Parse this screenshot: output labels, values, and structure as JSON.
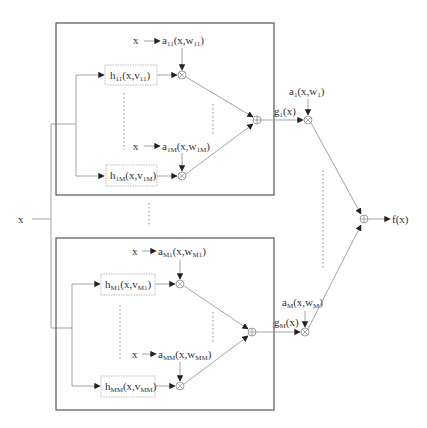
{
  "diagram": {
    "type": "hierarchical mixture of experts block diagram",
    "input_label": "x",
    "output_label": "f(x)",
    "groups": [
      {
        "id": "group-1",
        "experts": [
          {
            "h": "h",
            "h_sub": "11",
            "args_pre": "(x,v",
            "args_sub": "11",
            "args_post": ")",
            "gate_in": "x",
            "a": "a",
            "a_sub": "11",
            "a_pre": "(x,w",
            "a_arg_sub": "11",
            "a_post": ")"
          },
          {
            "h": "h",
            "h_sub": "1M",
            "args_pre": "(x,v",
            "args_sub": "1M",
            "args_post": ")",
            "gate_in": "x",
            "a": "a",
            "a_sub": "1M",
            "a_pre": "(x,w",
            "a_arg_sub": "1M",
            "a_post": ")"
          }
        ],
        "output": {
          "g": "g",
          "g_sub": "1",
          "g_post": "(x)"
        },
        "outer_gate": {
          "a": "a",
          "a_sub": "1",
          "a_pre": "(x,w",
          "a_arg_sub": "1",
          "a_post": ")"
        }
      },
      {
        "id": "group-M",
        "experts": [
          {
            "h": "h",
            "h_sub": "M1",
            "args_pre": "(x,v",
            "args_sub": "M1",
            "args_post": ")",
            "gate_in": "x",
            "a": "a",
            "a_sub": "M1",
            "a_pre": "(x,w",
            "a_arg_sub": "M1",
            "a_post": ")"
          },
          {
            "h": "h",
            "h_sub": "MM",
            "args_pre": "(x,v",
            "args_sub": "MM",
            "args_post": ")",
            "gate_in": "x",
            "a": "a",
            "a_sub": "MM",
            "a_pre": "(x,w",
            "a_arg_sub": "MM",
            "a_post": ")"
          }
        ],
        "output": {
          "g": "g",
          "g_sub": "M",
          "g_post": "(x)"
        },
        "outer_gate": {
          "a": "a",
          "a_sub": "M",
          "a_pre": "(x,w",
          "a_arg_sub": "M",
          "a_post": ")"
        }
      }
    ]
  }
}
